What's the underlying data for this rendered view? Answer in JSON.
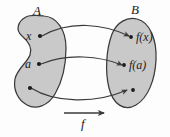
{
  "figure": {
    "type": "function-mapping-diagram",
    "background_color": "#fdfdfd",
    "blob_fill_color": "#c9c9c9",
    "stroke_color": "#3a3a3a",
    "text_color": "#1b1b1b"
  },
  "sets": {
    "domain": {
      "label": "A",
      "shape": "kidney-blob"
    },
    "codomain": {
      "label": "B",
      "shape": "oval-blob"
    }
  },
  "points": {
    "domain": [
      {
        "label": "x",
        "name": "point-x"
      },
      {
        "label": "a",
        "name": "point-a"
      },
      {
        "label": "",
        "name": "point-unlabeled-domain"
      }
    ],
    "codomain": [
      {
        "label": "f(x)",
        "name": "point-fx"
      },
      {
        "label": "f(a)",
        "name": "point-fa"
      },
      {
        "label": "",
        "name": "point-unlabeled-codomain"
      }
    ]
  },
  "arrows": [
    {
      "name": "arrow-x-to-fx",
      "from": "x",
      "to": "f(x)"
    },
    {
      "name": "arrow-a-to-fa",
      "from": "a",
      "to": "f(a)"
    },
    {
      "name": "arrow-third-point",
      "from": "",
      "to": ""
    }
  ],
  "function_arrow": {
    "label": "f",
    "name": "function-arrow"
  }
}
